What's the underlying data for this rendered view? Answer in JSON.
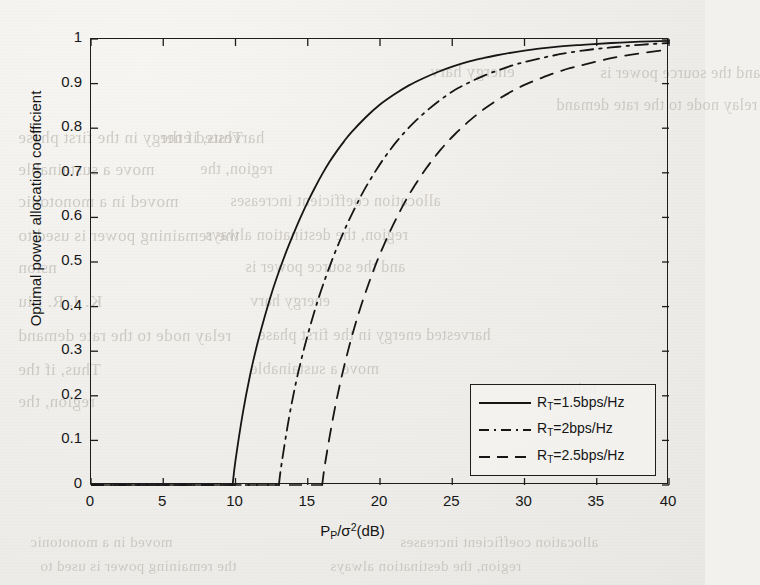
{
  "page": {
    "background_color": "#eeedea",
    "ink_color": "#1b1b1b",
    "bleed_through_text": [
      "energy harv",
      "relay node to the rate demand",
      "harvested energy in the first phase",
      "Thus, if the",
      "move a sustainable",
      "region, the",
      "moved in a monotonic",
      "allocation coefficient increases",
      "the remaining power is used to",
      "region, the destination always",
      "nsion",
      "and the source power is",
      "K. J. R. Liu"
    ]
  },
  "chart_data": {
    "type": "line",
    "title": "",
    "xlabel": "P_P/sigma^2(dB)",
    "ylabel": "Optimal power allocation coefficient",
    "xlim": [
      0,
      40
    ],
    "ylim": [
      0,
      1
    ],
    "xticks": [
      0,
      5,
      10,
      15,
      20,
      25,
      30,
      35,
      40
    ],
    "yticks": [
      0,
      0.1,
      0.2,
      0.3,
      0.4,
      0.5,
      0.6,
      0.7,
      0.8,
      0.9,
      1
    ],
    "xtick_labels": [
      "0",
      "5",
      "10",
      "15",
      "20",
      "25",
      "30",
      "35",
      "40"
    ],
    "ytick_labels": [
      "0",
      "0.1",
      "0.2",
      "0.3",
      "0.4",
      "0.5",
      "0.6",
      "0.7",
      "0.8",
      "0.9",
      "1"
    ],
    "grid": false,
    "legend_position": "lower right",
    "series": [
      {
        "name": "R_T=1.5bps/Hz",
        "linestyle": "solid",
        "color": "#161616",
        "onset_x": 9.8,
        "x": [
          9.8,
          10.0,
          10.5,
          11.0,
          11.5,
          12.0,
          12.5,
          13.0,
          13.5,
          14.0,
          14.5,
          15.0,
          15.5,
          16.0,
          16.5,
          17.0,
          17.5,
          18.0,
          19.0,
          20.0,
          21.0,
          22.0,
          23.0,
          24.0,
          25.0,
          26.0,
          27.0,
          28.0,
          30.0,
          32.0,
          34.0,
          36.0,
          38.0,
          40.0
        ],
        "y": [
          0.0,
          0.055,
          0.16,
          0.245,
          0.315,
          0.375,
          0.43,
          0.478,
          0.522,
          0.562,
          0.6,
          0.635,
          0.667,
          0.697,
          0.724,
          0.748,
          0.77,
          0.79,
          0.824,
          0.853,
          0.876,
          0.896,
          0.912,
          0.926,
          0.938,
          0.948,
          0.956,
          0.963,
          0.974,
          0.982,
          0.987,
          0.991,
          0.994,
          0.996
        ]
      },
      {
        "name": "R_T=2bps/Hz",
        "linestyle": "dashdot",
        "color": "#161616",
        "onset_x": 13.0,
        "x": [
          13.0,
          13.2,
          13.7,
          14.2,
          14.7,
          15.2,
          15.7,
          16.2,
          16.7,
          17.2,
          17.7,
          18.2,
          18.7,
          19.2,
          20.2,
          21.2,
          22.2,
          23.2,
          24.2,
          25.2,
          26.2,
          27.2,
          28.2,
          29.2,
          30.2,
          32.0,
          34.0,
          36.0,
          38.0,
          40.0
        ],
        "y": [
          0.0,
          0.05,
          0.15,
          0.232,
          0.3,
          0.36,
          0.414,
          0.462,
          0.506,
          0.546,
          0.583,
          0.617,
          0.649,
          0.678,
          0.729,
          0.772,
          0.808,
          0.838,
          0.864,
          0.886,
          0.903,
          0.918,
          0.93,
          0.941,
          0.95,
          0.963,
          0.974,
          0.981,
          0.987,
          0.991
        ]
      },
      {
        "name": "R_T=2.5bps/Hz",
        "linestyle": "dashed",
        "color": "#161616",
        "onset_x": 16.0,
        "x": [
          16.0,
          16.2,
          16.7,
          17.2,
          17.7,
          18.2,
          18.7,
          19.2,
          19.7,
          20.2,
          20.7,
          21.2,
          21.7,
          22.2,
          23.2,
          24.2,
          25.2,
          26.2,
          27.2,
          28.2,
          29.2,
          30.2,
          31.2,
          32.2,
          33.2,
          34.2,
          36.0,
          38.0,
          40.0
        ],
        "y": [
          0.0,
          0.048,
          0.142,
          0.222,
          0.29,
          0.35,
          0.403,
          0.45,
          0.494,
          0.533,
          0.569,
          0.602,
          0.633,
          0.661,
          0.71,
          0.752,
          0.787,
          0.817,
          0.843,
          0.865,
          0.884,
          0.9,
          0.913,
          0.925,
          0.935,
          0.943,
          0.957,
          0.968,
          0.976
        ]
      }
    ]
  },
  "legend": {
    "entries": [
      {
        "label_prefix": "R",
        "label_sub": "T",
        "label_suffix": "=1.5bps/Hz",
        "style": "solid"
      },
      {
        "label_prefix": "R",
        "label_sub": "T",
        "label_suffix": "=2bps/Hz",
        "style": "dashdot"
      },
      {
        "label_prefix": "R",
        "label_sub": "T",
        "label_suffix": "=2.5bps/Hz",
        "style": "dashed"
      }
    ]
  },
  "axis_titles": {
    "x_prefix": "P",
    "x_sub": "P",
    "x_mid": "/σ",
    "x_sup": "2",
    "x_suffix": "(dB)",
    "y": "Optimal power allocation coefficient"
  }
}
